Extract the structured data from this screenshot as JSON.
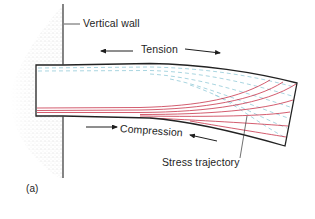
{
  "diagram": {
    "type": "cantilever-beam-stress-trajectories",
    "panel_label": "(a)",
    "labels": {
      "wall": "Vertical wall",
      "tension": "Tension",
      "compression": "Compression",
      "trajectory": "Stress trajectory"
    },
    "colors": {
      "outline": "#222222",
      "tension_lines": "#9fd0dc",
      "compression_lines": "#c8334a",
      "wall_stipple": "#8a8a8a",
      "text": "#1e1e1e"
    },
    "arrows": [
      {
        "name": "tension-left-arrow",
        "direction": "left"
      },
      {
        "name": "tension-right-arrow",
        "direction": "right"
      },
      {
        "name": "compression-right-arrow",
        "direction": "right"
      },
      {
        "name": "compression-left-arrow",
        "direction": "left"
      }
    ]
  }
}
